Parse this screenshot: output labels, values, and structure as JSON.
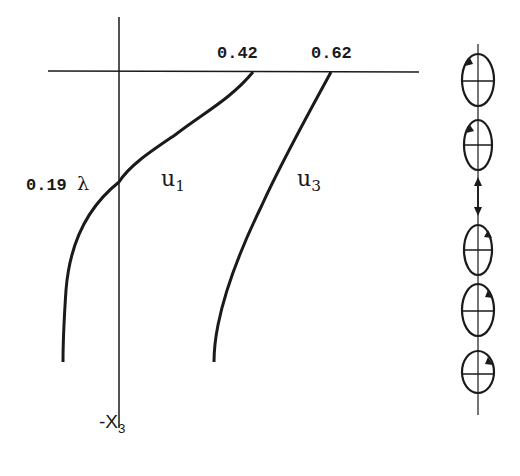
{
  "diagram": {
    "colors": {
      "line": "#1a1a1a",
      "background": "#ffffff"
    },
    "axes": {
      "horizontal_axis": {
        "label": ""
      },
      "vertical_axis": {
        "label_prefix": "-X",
        "label_subscript": "3"
      }
    },
    "curves": [
      {
        "id": "u1",
        "label_main": "u",
        "label_subscript": "1",
        "surface_value": "0.42"
      },
      {
        "id": "u3",
        "label_main": "u",
        "label_subscript": "3",
        "surface_value": "0.62"
      }
    ],
    "crossing_depth": {
      "value": "0.19",
      "unit": "λ"
    },
    "particle_orbits": {
      "count": 5,
      "above_node_rotation": "counterclockwise",
      "below_node_rotation": "clockwise",
      "node_marker": "double-arrow"
    }
  }
}
